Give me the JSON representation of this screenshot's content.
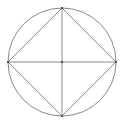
{
  "diagram": {
    "width": 122,
    "height": 123,
    "stroke_color": "#8a8a8a",
    "point_color": "#333333",
    "circle": {
      "cx": 62,
      "cy": 62,
      "r": 54
    },
    "points": [
      {
        "name": "top",
        "x": 62,
        "y": 8
      },
      {
        "name": "right",
        "x": 116,
        "y": 62
      },
      {
        "name": "bottom",
        "x": 62,
        "y": 116
      },
      {
        "name": "left",
        "x": 8,
        "y": 62
      },
      {
        "name": "center",
        "x": 62,
        "y": 62
      }
    ]
  }
}
